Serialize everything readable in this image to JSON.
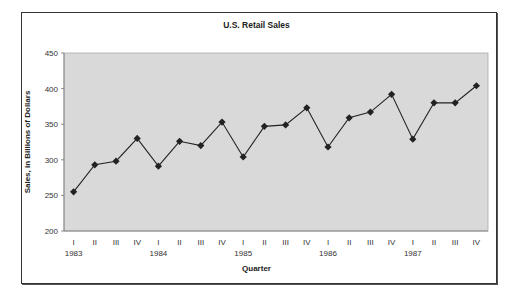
{
  "chart_data": {
    "type": "line",
    "title": "U.S. Retail Sales",
    "xlabel": "Quarter",
    "ylabel": "Sales, in Billions of Dollars",
    "ylim": [
      200,
      450
    ],
    "yticks": [
      200,
      250,
      300,
      350,
      400,
      450
    ],
    "grid": false,
    "legend": null,
    "plot_background": "#d9d9d9",
    "categories": [
      "I",
      "II",
      "III",
      "IV",
      "I",
      "II",
      "III",
      "IV",
      "I",
      "II",
      "III",
      "IV",
      "I",
      "II",
      "III",
      "IV",
      "I",
      "II",
      "III",
      "IV"
    ],
    "year_labels": [
      {
        "index": 0,
        "label": "1983"
      },
      {
        "index": 4,
        "label": "1984"
      },
      {
        "index": 8,
        "label": "1985"
      },
      {
        "index": 12,
        "label": "1986"
      },
      {
        "index": 16,
        "label": "1987"
      }
    ],
    "series": [
      {
        "name": "U.S. Retail Sales",
        "marker": "diamond",
        "color": "#222222",
        "values": [
          255,
          293,
          298,
          330,
          291,
          326,
          320,
          353,
          304,
          347,
          349,
          373,
          318,
          359,
          367,
          392,
          329,
          380,
          380,
          404
        ]
      }
    ]
  }
}
